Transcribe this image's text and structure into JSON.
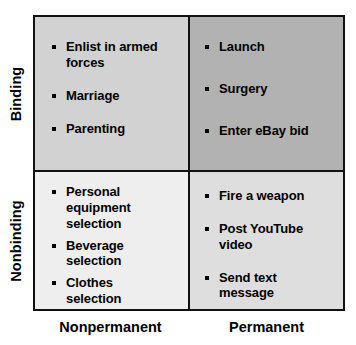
{
  "matrix": {
    "row_axis": {
      "labels": [
        {
          "id": "binding",
          "text": "Binding"
        },
        {
          "id": "nonbinding",
          "text": "Nonbinding"
        }
      ]
    },
    "column_axis": {
      "labels": [
        {
          "id": "nonpermanent",
          "text": "Nonpermanent"
        },
        {
          "id": "permanent",
          "text": "Permanent"
        }
      ]
    },
    "quadrants": {
      "binding_nonpermanent": {
        "fill": "#d2d2d2",
        "items": [
          "Enlist in  armed\nforces",
          "Marriage",
          "Parenting"
        ]
      },
      "binding_permanent": {
        "fill": "#b2b2b2",
        "items": [
          "Launch",
          "Surgery",
          "Enter eBay bid"
        ]
      },
      "nonbinding_nonpermanent": {
        "fill": "#eeeeee",
        "items": [
          "Personal\nequipment\nselection",
          "Beverage\nselection",
          "Clothes\nselection"
        ]
      },
      "nonbinding_permanent": {
        "fill": "#dedede",
        "items": [
          "Fire a weapon",
          "Post YouTube\nvideo",
          "Send text\n message"
        ]
      }
    },
    "colors": {
      "border": "#111111",
      "text": "#000000",
      "background": "#ffffff"
    }
  }
}
